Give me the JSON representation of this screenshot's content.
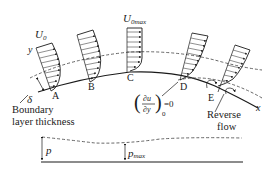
{
  "diagram": {
    "stations": [
      {
        "id": "A",
        "label": "A"
      },
      {
        "id": "B",
        "label": "B"
      },
      {
        "id": "C",
        "label": "C"
      },
      {
        "id": "D",
        "label": "D"
      },
      {
        "id": "E",
        "label": "E"
      }
    ],
    "free_stream_label": "U",
    "free_stream_sub": "0",
    "free_stream_max_label": "U",
    "free_stream_max_sub": "0max",
    "y_axis_label": "y",
    "x_axis_label": "x",
    "delta_label": "δ",
    "boundary_layer_label_line1": "Boundary",
    "boundary_layer_label_line2": "layer thickness",
    "separation_condition": {
      "numerator": "∂u",
      "denominator": "∂y",
      "subscript": "0",
      "equals": "=0"
    },
    "reverse_flow_line1": "Reverse",
    "reverse_flow_line2": "flow",
    "pressure_label": "p",
    "pressure_max_label": "p",
    "pressure_max_sub": "max",
    "colors": {
      "line": "#1a1a1a",
      "dashed": "#555555",
      "background": "#ffffff"
    }
  }
}
